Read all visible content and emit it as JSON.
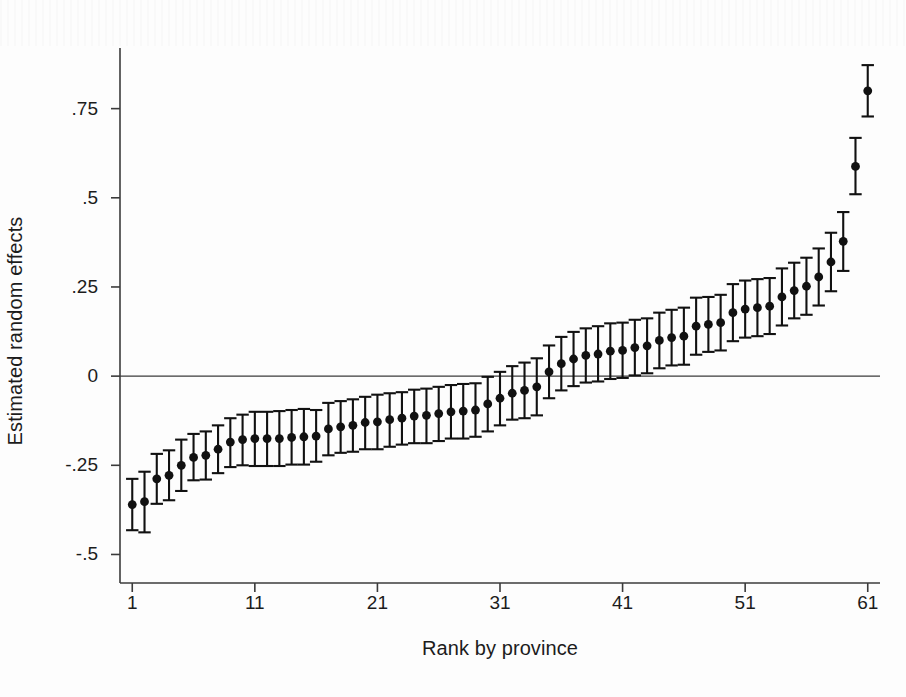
{
  "chart_data": {
    "type": "scatter",
    "title": "",
    "subtitle": "",
    "xlabel": "Rank by province",
    "ylabel": "Estimated random effects",
    "xlim": [
      0.0,
      62.0
    ],
    "ylim": [
      -0.58,
      0.92
    ],
    "xticks": [
      1,
      11,
      21,
      31,
      41,
      51,
      61
    ],
    "xtick_labels": [
      "1",
      "11",
      "21",
      "31",
      "41",
      "51",
      "61"
    ],
    "yticks": [
      -0.5,
      -0.25,
      0,
      0.25,
      0.5,
      0.75
    ],
    "ytick_labels": [
      "-.5",
      "-.25",
      "0",
      ".25",
      ".5",
      ".75"
    ],
    "grid": false,
    "legend": null,
    "reference_line": {
      "y": 0,
      "style": "solid",
      "color": "#3b3b3b"
    },
    "marker": {
      "shape": "circle",
      "color": "#111111",
      "size": 7
    },
    "errorbar": {
      "style": "capped",
      "color": "#111111",
      "interval": "95% CI"
    },
    "x": [
      1,
      2,
      3,
      4,
      5,
      6,
      7,
      8,
      9,
      10,
      11,
      12,
      13,
      14,
      15,
      16,
      17,
      18,
      19,
      20,
      21,
      22,
      23,
      24,
      25,
      26,
      27,
      28,
      29,
      30,
      31,
      32,
      33,
      34,
      35,
      36,
      37,
      38,
      39,
      40,
      41,
      42,
      43,
      44,
      45,
      46,
      47,
      48,
      49,
      50,
      51,
      52,
      53,
      54,
      55,
      56,
      57,
      58,
      59,
      60,
      61
    ],
    "values": [
      -0.36,
      -0.352,
      -0.288,
      -0.278,
      -0.25,
      -0.228,
      -0.222,
      -0.205,
      -0.185,
      -0.178,
      -0.175,
      -0.175,
      -0.175,
      -0.172,
      -0.17,
      -0.168,
      -0.148,
      -0.142,
      -0.138,
      -0.13,
      -0.128,
      -0.122,
      -0.118,
      -0.112,
      -0.11,
      -0.105,
      -0.1,
      -0.098,
      -0.095,
      -0.078,
      -0.062,
      -0.048,
      -0.04,
      -0.03,
      0.012,
      0.035,
      0.048,
      0.058,
      0.062,
      0.07,
      0.072,
      0.08,
      0.085,
      0.1,
      0.108,
      0.112,
      0.14,
      0.145,
      0.15,
      0.178,
      0.188,
      0.192,
      0.196,
      0.222,
      0.24,
      0.252,
      0.278,
      0.32,
      0.378,
      0.588,
      0.8
    ],
    "ci_lower": [
      -0.432,
      -0.438,
      -0.358,
      -0.348,
      -0.322,
      -0.292,
      -0.29,
      -0.272,
      -0.255,
      -0.25,
      -0.252,
      -0.252,
      -0.252,
      -0.248,
      -0.248,
      -0.24,
      -0.222,
      -0.215,
      -0.212,
      -0.205,
      -0.205,
      -0.198,
      -0.192,
      -0.188,
      -0.188,
      -0.182,
      -0.175,
      -0.175,
      -0.17,
      -0.155,
      -0.138,
      -0.122,
      -0.118,
      -0.11,
      -0.062,
      -0.04,
      -0.028,
      -0.018,
      -0.015,
      -0.008,
      -0.005,
      0.002,
      0.008,
      0.022,
      0.03,
      0.032,
      0.06,
      0.068,
      0.072,
      0.098,
      0.108,
      0.112,
      0.118,
      0.142,
      0.162,
      0.172,
      0.198,
      0.238,
      0.295,
      0.51,
      0.728
    ],
    "ci_upper": [
      -0.288,
      -0.268,
      -0.218,
      -0.208,
      -0.178,
      -0.162,
      -0.155,
      -0.138,
      -0.118,
      -0.108,
      -0.1,
      -0.1,
      -0.098,
      -0.095,
      -0.092,
      -0.095,
      -0.075,
      -0.07,
      -0.065,
      -0.058,
      -0.052,
      -0.048,
      -0.045,
      -0.038,
      -0.035,
      -0.03,
      -0.025,
      -0.022,
      -0.02,
      -0.002,
      0.012,
      0.028,
      0.038,
      0.05,
      0.086,
      0.11,
      0.124,
      0.134,
      0.14,
      0.148,
      0.15,
      0.158,
      0.162,
      0.178,
      0.186,
      0.192,
      0.22,
      0.222,
      0.228,
      0.258,
      0.268,
      0.272,
      0.275,
      0.302,
      0.318,
      0.332,
      0.358,
      0.402,
      0.46,
      0.668,
      0.872
    ]
  }
}
